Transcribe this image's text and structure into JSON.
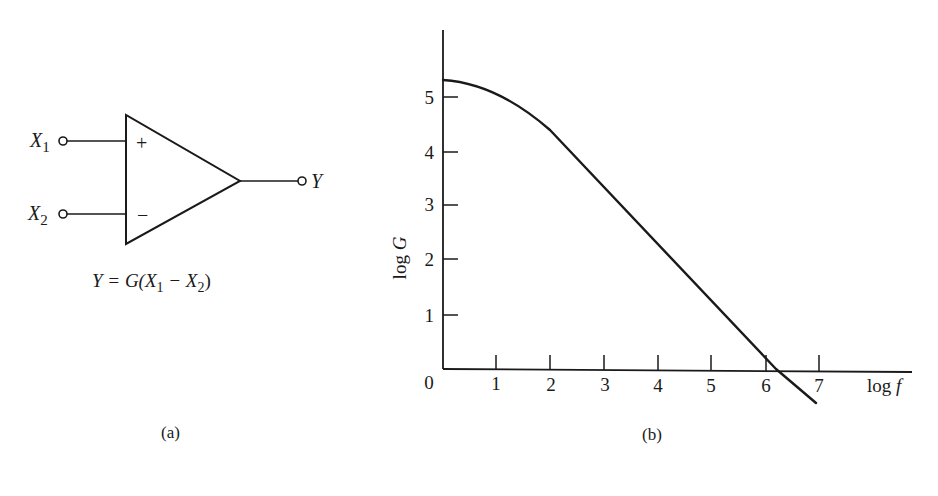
{
  "panel_a": {
    "caption": "(a)",
    "input1_label": "X",
    "input1_sub": "1",
    "input2_label": "X",
    "input2_sub": "2",
    "output_label": "Y",
    "plus_sign": "+",
    "minus_sign": "−",
    "equation": {
      "lhs": "Y = G(X",
      "sub1": "1",
      "mid": " − X",
      "sub2": "2",
      "rhs": ")"
    }
  },
  "panel_b": {
    "caption": "(b)",
    "ylabel": "log G",
    "xlabel": "log f",
    "origin_label": "0",
    "x_ticks": [
      "1",
      "2",
      "3",
      "4",
      "5",
      "6",
      "7"
    ],
    "y_ticks": [
      "1",
      "2",
      "3",
      "4",
      "5"
    ]
  },
  "chart_data": {
    "type": "line",
    "title": "",
    "xlabel": "log f",
    "ylabel": "log G",
    "xlim": [
      0,
      7.5
    ],
    "ylim": [
      -0.6,
      6.3
    ],
    "grid": false,
    "legend": "none",
    "x_ticks": [
      0,
      1,
      2,
      3,
      4,
      5,
      6,
      7
    ],
    "y_ticks": [
      1,
      2,
      3,
      4,
      5
    ],
    "series": [
      {
        "name": "open-loop gain",
        "x": [
          0,
          0.5,
          1.0,
          1.5,
          2.0,
          3.0,
          4.0,
          5.0,
          6.0,
          6.2,
          6.6
        ],
        "y": [
          5.3,
          5.2,
          4.95,
          4.6,
          4.2,
          3.2,
          2.2,
          1.2,
          0.2,
          0.0,
          -0.6
        ]
      }
    ],
    "annotations": [
      "Y = G(X1 − X2)"
    ]
  }
}
